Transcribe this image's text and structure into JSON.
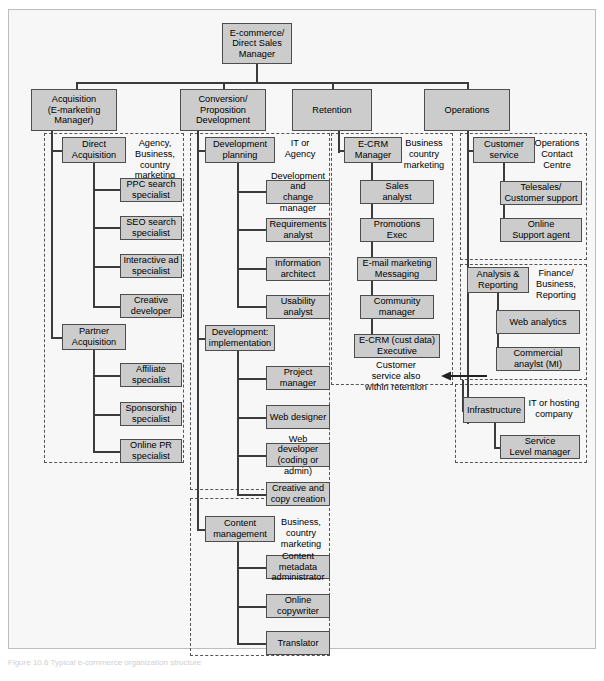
{
  "figure": {
    "background_color": "#f7f7f7",
    "box_fill": "#cccccc",
    "box_border": "#4d4d4d",
    "line_color": "#3b3b3b",
    "group_border": "#555555",
    "caption": "Figure 10.6 Typical e-commerce organization structure"
  },
  "root": {
    "label": "E-commerce/\nDirect Sales\nManager"
  },
  "level1": [
    {
      "label": "Acquisition\n(E-marketing\nManager)"
    },
    {
      "label": "Conversion/\nProposition\nDevelopment"
    },
    {
      "label": "Retention"
    },
    {
      "label": "Operations"
    }
  ],
  "acquisition": {
    "groups": [
      {
        "lead": "Direct\nAcquisition",
        "partner_caption": "Agency,\nBusiness,\ncountry\nmarketing",
        "reports": [
          "PPC search\nspecialist",
          "SEO search\nspecialist",
          "Interactive ad\nspecialist",
          "Creative\ndeveloper"
        ]
      },
      {
        "lead": "Partner\nAcquisition",
        "partner_caption": "",
        "reports": [
          "Affiliate\nspecialist",
          "Sponsorship\nspecialist",
          "Online PR\nspecialist"
        ]
      }
    ]
  },
  "conversion": {
    "groups": [
      {
        "lead": "Development\nplanning",
        "partner_caption": "IT or\nAgency",
        "reports": [
          "Development and\nchange manager",
          "Requirements\nanalyst",
          "Information\narchitect",
          "Usability\nanalyst"
        ]
      },
      {
        "lead": "Development:\nimplementation",
        "partner_caption": "",
        "reports": [
          "Project\nmanager",
          "Web designer",
          "Web developer\n(coding or admin)",
          "Creative and\ncopy creation"
        ]
      },
      {
        "lead": "Content\nmanagement",
        "partner_caption": "Business,\ncountry\nmarketing",
        "reports": [
          "Content metadata\nadministrator",
          "Online\ncopywriter",
          "Translator"
        ]
      }
    ]
  },
  "retention": {
    "groups": [
      {
        "lead": "E-CRM\nManager",
        "partner_caption": "Business\ncountry\nmarketing",
        "reports": [
          "Sales\nanalyst",
          "Promotions\nExec",
          "E-mail marketing\nMessaging",
          "Community\nmanager",
          "E-CRM (cust data)\nExecutive"
        ],
        "note": "Customer\nservice also\nwithin retention"
      }
    ]
  },
  "operations": {
    "groups": [
      {
        "lead": "Customer\nservice",
        "partner_caption": "Operations\nContact\nCentre",
        "reports": [
          "Telesales/\nCustomer support",
          "Online\nSupport agent"
        ]
      },
      {
        "lead": "Analysis &\nReporting",
        "partner_caption": "Finance/\nBusiness,\nReporting",
        "reports": [
          "Web analytics",
          "Commercial\nanaylst (MI)"
        ]
      },
      {
        "lead": "Infrastructure",
        "partner_caption": "IT or hosting\ncompany",
        "reports": [
          "Service\nLevel manager"
        ]
      }
    ]
  }
}
